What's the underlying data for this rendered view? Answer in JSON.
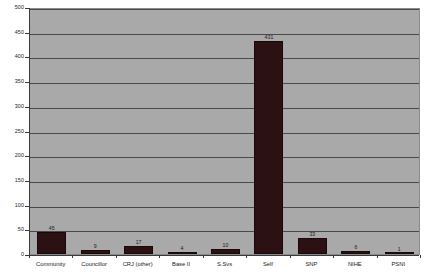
{
  "chart_data": {
    "type": "bar",
    "title": "",
    "subtitle": "",
    "xlabel": "",
    "ylabel": "",
    "categories": [
      "Community",
      "Councillor",
      "CRJ (other)",
      "Base II",
      "S.Svs",
      "Self",
      "SNP",
      "NIHE",
      "PSNI"
    ],
    "values": [
      45,
      9,
      17,
      4,
      10,
      431,
      33,
      6,
      1
    ],
    "data_labels": [
      "45",
      "9",
      "17",
      "4",
      "10",
      "431",
      "33",
      "6",
      "1"
    ],
    "ylim": [
      0,
      500
    ],
    "ytick_step": 50,
    "yticks": [
      0,
      50,
      100,
      150,
      200,
      250,
      300,
      350,
      400,
      450,
      500
    ],
    "ytick_labels": [
      "0",
      "50",
      "100",
      "150",
      "200",
      "250",
      "300",
      "350",
      "400",
      "450",
      "500"
    ],
    "grid": true,
    "grid_axis": "y",
    "legend": false,
    "legend_position": "none",
    "series": [
      {
        "name": "",
        "values": [
          45,
          9,
          17,
          4,
          10,
          431,
          33,
          6,
          1
        ]
      }
    ]
  },
  "style": {
    "plot_background": "#a9a9a9",
    "page_background": "#ffffff",
    "bar_color": "#2b1111",
    "gridline_color": "#4a4a4a",
    "axis_color": "#3a3a3a",
    "text_color": "#1a1a1a"
  }
}
